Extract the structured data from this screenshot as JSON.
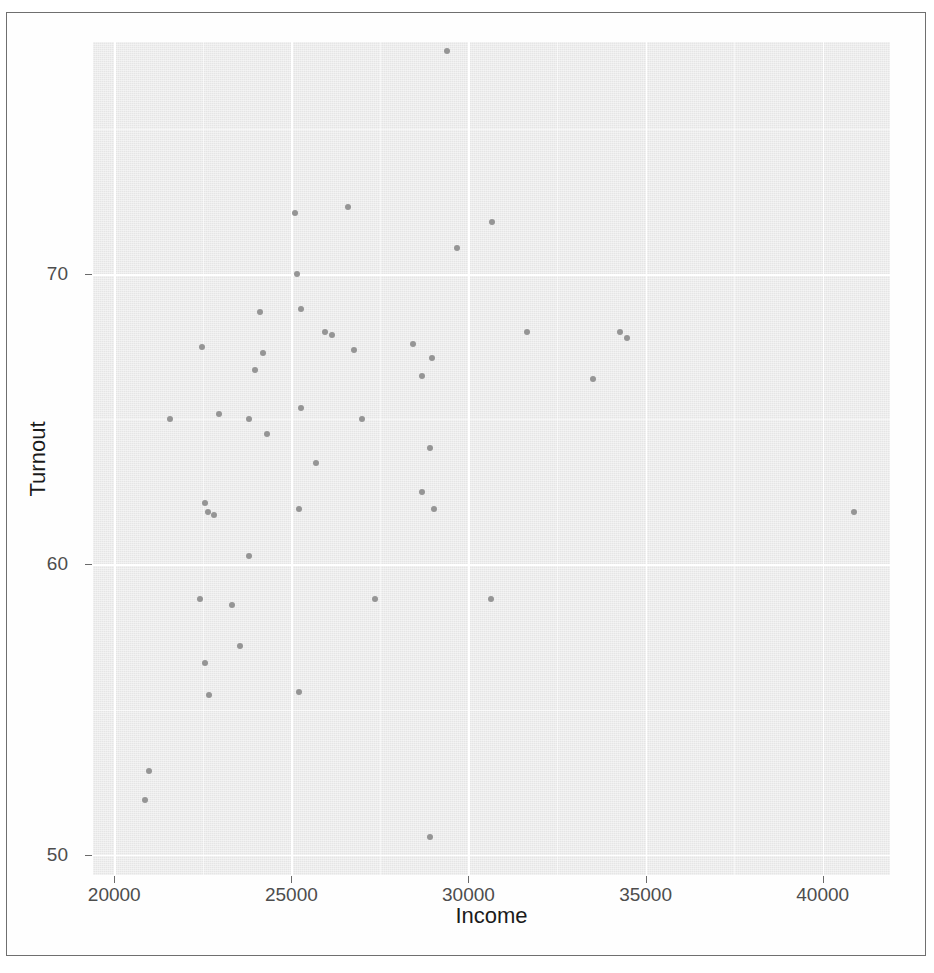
{
  "figure": {
    "background_color": "#ffffff",
    "panel_background_color": "#ebebeb",
    "grid_color": "#ffffff",
    "point_color": "#8d8d8d",
    "axis_text_color": "#4d4d4d",
    "axis_title_color": "#1a1a1a"
  },
  "chart_data": {
    "type": "scatter",
    "title": "",
    "subtitle": "",
    "xlabel": "Income",
    "ylabel": "Turnout",
    "xlim": [
      19400,
      41900
    ],
    "ylim": [
      49.3,
      78.0
    ],
    "xticks": [
      20000,
      25000,
      30000,
      35000,
      40000
    ],
    "xtick_labels": [
      "20000",
      "25000",
      "30000",
      "35000",
      "40000"
    ],
    "yticks": [
      50,
      60,
      70
    ],
    "ytick_labels": [
      "50",
      "60",
      "70"
    ],
    "grid": true,
    "minor_grid": true,
    "legend": null,
    "legend_position": "none",
    "annotations": [],
    "series": [
      {
        "name": "observations",
        "marker": "circle",
        "color": "#8d8d8d",
        "points": [
          {
            "x": 29390,
            "y": 77.7
          },
          {
            "x": 25110,
            "y": 72.1
          },
          {
            "x": 26600,
            "y": 72.3
          },
          {
            "x": 30660,
            "y": 71.8
          },
          {
            "x": 29670,
            "y": 70.9
          },
          {
            "x": 25160,
            "y": 70.0
          },
          {
            "x": 24110,
            "y": 68.7
          },
          {
            "x": 25270,
            "y": 68.8
          },
          {
            "x": 25940,
            "y": 68.0
          },
          {
            "x": 26160,
            "y": 67.9
          },
          {
            "x": 31660,
            "y": 68.0
          },
          {
            "x": 34290,
            "y": 68.0
          },
          {
            "x": 34480,
            "y": 67.8
          },
          {
            "x": 22490,
            "y": 67.5
          },
          {
            "x": 24200,
            "y": 67.3
          },
          {
            "x": 26770,
            "y": 67.4
          },
          {
            "x": 28440,
            "y": 67.6
          },
          {
            "x": 28970,
            "y": 67.1
          },
          {
            "x": 23960,
            "y": 66.7
          },
          {
            "x": 28680,
            "y": 66.5
          },
          {
            "x": 33510,
            "y": 66.4
          },
          {
            "x": 25270,
            "y": 65.4
          },
          {
            "x": 22950,
            "y": 65.2
          },
          {
            "x": 21570,
            "y": 65.0
          },
          {
            "x": 23790,
            "y": 65.0
          },
          {
            "x": 26980,
            "y": 65.0
          },
          {
            "x": 24300,
            "y": 64.5
          },
          {
            "x": 28900,
            "y": 64.0
          },
          {
            "x": 25690,
            "y": 63.5
          },
          {
            "x": 28680,
            "y": 62.5
          },
          {
            "x": 22550,
            "y": 62.1
          },
          {
            "x": 22660,
            "y": 61.8
          },
          {
            "x": 22830,
            "y": 61.7
          },
          {
            "x": 25220,
            "y": 61.9
          },
          {
            "x": 29030,
            "y": 61.9
          },
          {
            "x": 40890,
            "y": 61.8
          },
          {
            "x": 23790,
            "y": 60.3
          },
          {
            "x": 22410,
            "y": 58.8
          },
          {
            "x": 23310,
            "y": 58.6
          },
          {
            "x": 27350,
            "y": 58.8
          },
          {
            "x": 30630,
            "y": 58.8
          },
          {
            "x": 23560,
            "y": 57.2
          },
          {
            "x": 22570,
            "y": 56.6
          },
          {
            "x": 22680,
            "y": 55.5
          },
          {
            "x": 25220,
            "y": 55.6
          },
          {
            "x": 20970,
            "y": 52.9
          },
          {
            "x": 20860,
            "y": 51.9
          },
          {
            "x": 28900,
            "y": 50.6
          }
        ]
      }
    ]
  }
}
